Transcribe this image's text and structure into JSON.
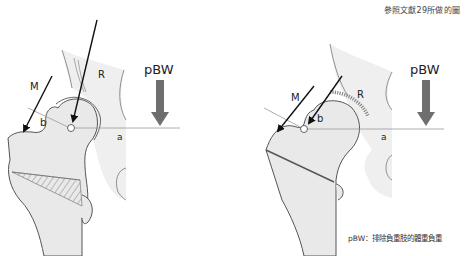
{
  "source_note": "參照文獻29所做的圖",
  "legend_note": "pBW：排除負重肢的體重負重",
  "bottom_caption_partial": "",
  "diagrams": [
    {
      "id": "left",
      "labels": {
        "muscle_force": "M",
        "joint_reaction": "R",
        "body_weight": "pBW",
        "lever_b": "b",
        "lever_a": "a"
      }
    },
    {
      "id": "right",
      "labels": {
        "muscle_force": "M",
        "joint_reaction": "R",
        "body_weight": "pBW",
        "lever_b": "b",
        "lever_a": "a"
      }
    }
  ],
  "colors": {
    "bone_fill": "#e9e9e9",
    "outline": "#555555",
    "arrow_black": "#111111",
    "arrow_gray": "#6e6e6e",
    "lever_line": "#999999"
  }
}
